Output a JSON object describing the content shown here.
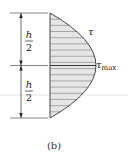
{
  "figure": {
    "caption": "(b)"
  },
  "dimensions": {
    "upper_label_numerator": "h",
    "upper_label_denominator": "2",
    "lower_label_numerator": "h",
    "lower_label_denominator": "2"
  },
  "labels": {
    "tau": "τ",
    "tau_max_symbol": "τ",
    "tau_max_subscript": "max"
  },
  "colors": {
    "fill": "#e6e6e6",
    "stroke": "#333333",
    "hatch": "#7a7a7a",
    "faint_line": "#d8d8d8",
    "text": "#222222"
  },
  "geometry": {
    "top_y": 13,
    "mid_y": 65,
    "bottom_y": 118,
    "base_x": 50,
    "vertex_x": 96,
    "dim_x": 21,
    "hatch_count": 17
  }
}
